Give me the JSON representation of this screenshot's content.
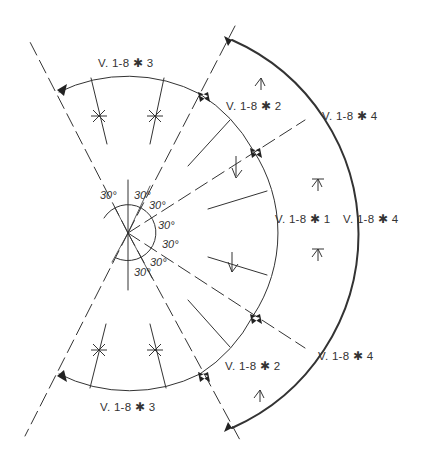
{
  "diagram": {
    "type": "radial stair / segmented arc layout",
    "center": {
      "x": 128,
      "y": 233
    },
    "inner_radius": 146,
    "outer_radius": 205,
    "angle_labels": [
      "30°",
      "30°",
      "30°",
      "30°",
      "30°",
      "30°",
      "30°"
    ],
    "section_labels": {
      "top_inner": "V. 1-8 ✱ 3",
      "upper_mid": "V. 1-8 ✱ 2",
      "upper_right": "V. 1-8 ✱ 4",
      "center_inner": "V. 1-8 ✱ 1",
      "center_outer": "V. 1-8 ✱ 4",
      "lower_mid": "V. 1-8 ✱ 2",
      "lower_right": "V. 1-8 ✱ 4",
      "bottom_inner": "V. 1-8 ✱ 3"
    },
    "colors": {
      "line": "#333333",
      "background": "#ffffff"
    }
  }
}
